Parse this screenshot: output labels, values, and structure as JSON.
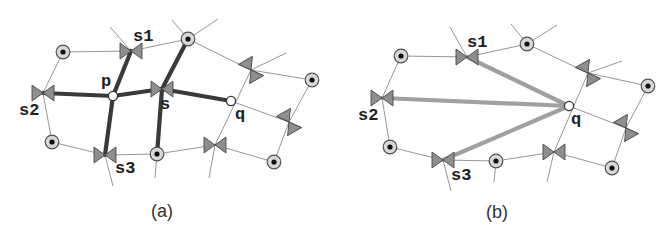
{
  "figure": {
    "colors": {
      "background": "#ffffff",
      "thin_edge": "#8a8a8a",
      "thick_edge_a": "#3a3a3a",
      "thick_edge_b": "#a0a0a0",
      "bowtie_fill": "#8e8e8e",
      "site_ring": "#d8d8d8"
    },
    "panels": [
      {
        "id": "a",
        "caption": "(a)",
        "caption_pos": [
          162,
          217
        ],
        "sites": [
          {
            "id": "a_site_tl",
            "x": 63,
            "y": 52
          },
          {
            "id": "a_site_top",
            "x": 188,
            "y": 39
          },
          {
            "id": "a_site_r",
            "x": 312,
            "y": 80
          },
          {
            "id": "a_site_bl",
            "x": 52,
            "y": 142
          },
          {
            "id": "a_site_bot",
            "x": 157,
            "y": 154
          },
          {
            "id": "a_site_br",
            "x": 274,
            "y": 162
          }
        ],
        "bowties": [
          {
            "id": "s1",
            "x": 131,
            "y": 51,
            "angle": 0,
            "label": "s1",
            "label_dx": 2,
            "label_dy": -10
          },
          {
            "id": "s2",
            "x": 43,
            "y": 93,
            "angle": 0,
            "label": "s2",
            "label_dx": -24,
            "label_dy": 22
          },
          {
            "id": "s3",
            "x": 105,
            "y": 155,
            "angle": 0,
            "label": "s3",
            "label_dx": 10,
            "label_dy": 18
          },
          {
            "id": "s",
            "x": 162,
            "y": 89,
            "angle": 0,
            "label": "s",
            "label_dx": -2,
            "label_dy": 20
          },
          {
            "id": "b_ur",
            "x": 251,
            "y": 70,
            "angle": 60,
            "label": ""
          },
          {
            "id": "b_r",
            "x": 289,
            "y": 122,
            "angle": 60,
            "label": ""
          },
          {
            "id": "b_bot",
            "x": 215,
            "y": 145,
            "angle": 0,
            "label": ""
          }
        ],
        "queries": [
          {
            "id": "p",
            "x": 113,
            "y": 96,
            "label": "p",
            "label_dx": -12,
            "label_dy": -10
          },
          {
            "id": "q",
            "x": 231,
            "y": 101,
            "label": "q",
            "label_dx": 4,
            "label_dy": 18
          }
        ],
        "thin_edges": [
          [
            63,
            52,
            131,
            51
          ],
          [
            131,
            51,
            188,
            39
          ],
          [
            131,
            51,
            110,
            27
          ],
          [
            188,
            39,
            172,
            20
          ],
          [
            188,
            39,
            218,
            19
          ],
          [
            188,
            39,
            251,
            70
          ],
          [
            251,
            70,
            286,
            53
          ],
          [
            251,
            70,
            312,
            80
          ],
          [
            251,
            70,
            215,
            145
          ],
          [
            312,
            80,
            289,
            122
          ],
          [
            289,
            122,
            274,
            162
          ],
          [
            231,
            101,
            289,
            122
          ],
          [
            215,
            145,
            274,
            162
          ],
          [
            215,
            145,
            157,
            154
          ],
          [
            215,
            145,
            209,
            178
          ],
          [
            63,
            52,
            43,
            93
          ],
          [
            43,
            93,
            52,
            142
          ],
          [
            52,
            142,
            105,
            155
          ],
          [
            105,
            155,
            157,
            154
          ],
          [
            105,
            155,
            113,
            186
          ],
          [
            157,
            154,
            155,
            178
          ]
        ],
        "thick_edges": [
          [
            113,
            96,
            131,
            51
          ],
          [
            113,
            96,
            43,
            93
          ],
          [
            113,
            96,
            105,
            155
          ],
          [
            113,
            96,
            162,
            89
          ],
          [
            162,
            89,
            188,
            39
          ],
          [
            162,
            89,
            157,
            154
          ],
          [
            162,
            89,
            231,
            101
          ]
        ]
      },
      {
        "id": "b",
        "caption": "(b)",
        "caption_pos": [
          497,
          218
        ],
        "sites": [
          {
            "id": "b_site_tl",
            "x": 401,
            "y": 56
          },
          {
            "id": "b_site_top",
            "x": 527,
            "y": 44
          },
          {
            "id": "b_site_r",
            "x": 648,
            "y": 86
          },
          {
            "id": "b_site_bl",
            "x": 390,
            "y": 147
          },
          {
            "id": "b_site_bot",
            "x": 496,
            "y": 161
          },
          {
            "id": "b_site_br",
            "x": 612,
            "y": 168
          }
        ],
        "bowties": [
          {
            "id": "s1",
            "x": 467,
            "y": 57,
            "angle": 0,
            "label": "s1",
            "label_dx": 0,
            "label_dy": -10
          },
          {
            "id": "s2",
            "x": 382,
            "y": 98,
            "angle": 0,
            "label": "s2",
            "label_dx": -24,
            "label_dy": 22
          },
          {
            "id": "s3",
            "x": 443,
            "y": 160,
            "angle": 0,
            "label": "s3",
            "label_dx": 8,
            "label_dy": 20
          },
          {
            "id": "b_ur",
            "x": 588,
            "y": 73,
            "angle": 60,
            "label": ""
          },
          {
            "id": "b_r",
            "x": 626,
            "y": 128,
            "angle": 60,
            "label": ""
          },
          {
            "id": "b_bot",
            "x": 554,
            "y": 152,
            "angle": 0,
            "label": ""
          }
        ],
        "queries": [
          {
            "id": "q",
            "x": 569,
            "y": 106,
            "label": "q",
            "label_dx": 2,
            "label_dy": 18
          }
        ],
        "thin_edges": [
          [
            401,
            56,
            467,
            57
          ],
          [
            467,
            57,
            527,
            44
          ],
          [
            467,
            57,
            450,
            27
          ],
          [
            527,
            44,
            511,
            24
          ],
          [
            527,
            44,
            557,
            25
          ],
          [
            527,
            44,
            588,
            73
          ],
          [
            588,
            73,
            622,
            61
          ],
          [
            588,
            73,
            648,
            86
          ],
          [
            588,
            73,
            554,
            152
          ],
          [
            648,
            86,
            626,
            128
          ],
          [
            626,
            128,
            612,
            168
          ],
          [
            569,
            106,
            626,
            128
          ],
          [
            554,
            152,
            612,
            168
          ],
          [
            554,
            152,
            496,
            161
          ],
          [
            554,
            152,
            547,
            182
          ],
          [
            401,
            56,
            382,
            98
          ],
          [
            382,
            98,
            390,
            147
          ],
          [
            390,
            147,
            443,
            160
          ],
          [
            443,
            160,
            496,
            161
          ],
          [
            443,
            160,
            451,
            191
          ],
          [
            496,
            161,
            494,
            182
          ]
        ],
        "thick_edges": [
          [
            569,
            106,
            467,
            57
          ],
          [
            569,
            106,
            382,
            98
          ],
          [
            569,
            106,
            443,
            160
          ]
        ]
      }
    ]
  }
}
